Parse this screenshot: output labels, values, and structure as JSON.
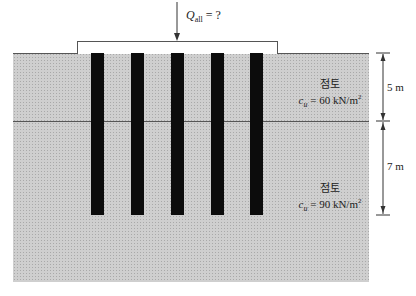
{
  "load": {
    "symbol": "Q",
    "subscript": "all",
    "rest": " = ?"
  },
  "layers": [
    {
      "name": "점토",
      "param": "c",
      "param_sub": "u",
      "value": " = 60 kN/m",
      "sup": "2",
      "thickness": "5 m"
    },
    {
      "name": "점토",
      "param": "c",
      "param_sub": "u",
      "value": " = 90 kN/m",
      "sup": "2",
      "thickness": "7 m"
    }
  ],
  "piles": {
    "count": 5
  },
  "colors": {
    "soil": "#cfcfcf",
    "pile": "#0c0c0c",
    "line": "#555555"
  }
}
